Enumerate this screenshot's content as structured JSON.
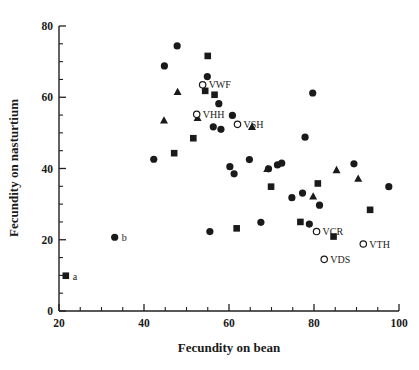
{
  "chart_data": {
    "type": "scatter",
    "title": "",
    "xlabel": "Fecundity on bean",
    "ylabel": "Fecundity on nasturtium",
    "xlim": [
      20,
      100
    ],
    "ylim": [
      0,
      80
    ],
    "xticks": [
      20,
      40,
      60,
      80,
      100
    ],
    "yticks": [
      0,
      20,
      40,
      60,
      80
    ],
    "xtick_labels": [
      "20",
      "40",
      "60",
      "80",
      "100"
    ],
    "ytick_labels": [
      "0",
      "20",
      "40",
      "60",
      "80"
    ],
    "x_minor_step": 5,
    "y_minor_step": 5,
    "grid": false,
    "legend": "none",
    "series": [
      {
        "name": "filled-circle",
        "marker": "circle",
        "fill": "#1a1a1a",
        "points": [
          {
            "x": 33.1,
            "y": 20.7,
            "label": "b"
          },
          {
            "x": 42.3,
            "y": 42.6
          },
          {
            "x": 44.8,
            "y": 68.8
          },
          {
            "x": 47.8,
            "y": 74.4
          },
          {
            "x": 54.9,
            "y": 65.8
          },
          {
            "x": 55.5,
            "y": 22.3
          },
          {
            "x": 56.3,
            "y": 51.7
          },
          {
            "x": 57.6,
            "y": 58.2
          },
          {
            "x": 58.1,
            "y": 51.0
          },
          {
            "x": 60.2,
            "y": 40.5
          },
          {
            "x": 60.8,
            "y": 54.9
          },
          {
            "x": 61.2,
            "y": 38.5
          },
          {
            "x": 64.8,
            "y": 42.5
          },
          {
            "x": 67.5,
            "y": 24.9
          },
          {
            "x": 69.3,
            "y": 39.9
          },
          {
            "x": 71.4,
            "y": 41.0
          },
          {
            "x": 72.4,
            "y": 41.5
          },
          {
            "x": 74.8,
            "y": 31.8
          },
          {
            "x": 77.3,
            "y": 33.1
          },
          {
            "x": 77.9,
            "y": 48.8
          },
          {
            "x": 78.9,
            "y": 24.4
          },
          {
            "x": 79.7,
            "y": 61.2
          },
          {
            "x": 81.3,
            "y": 29.7
          },
          {
            "x": 89.4,
            "y": 41.3
          },
          {
            "x": 97.6,
            "y": 34.9
          }
        ]
      },
      {
        "name": "filled-square",
        "marker": "square",
        "fill": "#1a1a1a",
        "points": [
          {
            "x": 21.6,
            "y": 9.9,
            "label": "a"
          },
          {
            "x": 47.1,
            "y": 44.3
          },
          {
            "x": 51.6,
            "y": 48.5
          },
          {
            "x": 54.4,
            "y": 61.8
          },
          {
            "x": 55.0,
            "y": 71.6
          },
          {
            "x": 56.6,
            "y": 60.7
          },
          {
            "x": 61.8,
            "y": 23.2
          },
          {
            "x": 69.9,
            "y": 34.9
          },
          {
            "x": 76.8,
            "y": 25.0
          },
          {
            "x": 80.9,
            "y": 35.8
          },
          {
            "x": 84.6,
            "y": 20.9
          },
          {
            "x": 93.2,
            "y": 28.4
          }
        ]
      },
      {
        "name": "filled-triangle",
        "marker": "triangle",
        "fill": "#1a1a1a",
        "points": [
          {
            "x": 44.7,
            "y": 53.5
          },
          {
            "x": 47.9,
            "y": 61.5
          },
          {
            "x": 52.6,
            "y": 54.2
          },
          {
            "x": 65.4,
            "y": 51.7
          },
          {
            "x": 69.0,
            "y": 39.9
          },
          {
            "x": 79.8,
            "y": 32.2
          },
          {
            "x": 85.3,
            "y": 39.6
          },
          {
            "x": 90.4,
            "y": 37.2
          }
        ]
      },
      {
        "name": "open-circle",
        "marker": "open-circle",
        "fill": "#ffffff",
        "points": [
          {
            "x": 53.8,
            "y": 63.5,
            "label": "VWF"
          },
          {
            "x": 52.4,
            "y": 55.2,
            "label": "VHH"
          },
          {
            "x": 62.0,
            "y": 52.4,
            "label": "VSH"
          },
          {
            "x": 80.6,
            "y": 22.3,
            "label": "VCR"
          },
          {
            "x": 91.6,
            "y": 18.8,
            "label": "VTH"
          },
          {
            "x": 82.4,
            "y": 14.5,
            "label": "VDS"
          }
        ]
      }
    ]
  },
  "labels": {
    "a": "a",
    "b": "b",
    "vwf": "VWF",
    "vhh": "VHH",
    "vsh": "VSH",
    "vcr": "VCR",
    "vth": "VTH",
    "vds": "VDS"
  }
}
